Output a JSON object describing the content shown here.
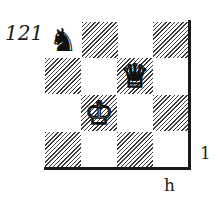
{
  "diagram": {
    "number": "121",
    "rank_label": "1",
    "file_label": "h",
    "board": {
      "files_shown": [
        "e",
        "f",
        "g",
        "h"
      ],
      "ranks_shown": [
        "4",
        "3",
        "2",
        "1"
      ],
      "square_colors": [
        [
          "light",
          "dark",
          "light",
          "dark"
        ],
        [
          "dark",
          "light",
          "dark",
          "light"
        ],
        [
          "light",
          "dark",
          "light",
          "dark"
        ],
        [
          "dark",
          "light",
          "dark",
          "light"
        ]
      ],
      "pieces": [
        {
          "piece": "knight",
          "color": "black",
          "glyph": "♞",
          "square": "e4",
          "col": 0,
          "row": 0
        },
        {
          "piece": "queen",
          "color": "white",
          "glyph": "♕",
          "square": "g3",
          "col": 2,
          "row": 1
        },
        {
          "piece": "king",
          "color": "white",
          "glyph": "♔",
          "square": "f2",
          "col": 1,
          "row": 2
        }
      ]
    },
    "colors": {
      "dark_square_hatch": "#3a3a3a",
      "light_square": "#ffffff",
      "border": "#1a1a1a"
    }
  }
}
